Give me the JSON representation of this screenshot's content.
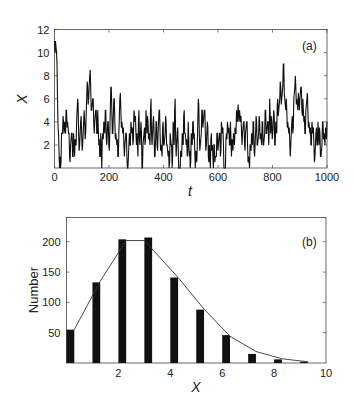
{
  "chart_data": [
    {
      "type": "line",
      "panel_label": "(a)",
      "title": "",
      "xlabel": "t",
      "ylabel": "X",
      "xlim": [
        0,
        1000
      ],
      "ylim": [
        0,
        12
      ],
      "xticks": [
        0,
        200,
        400,
        600,
        800,
        1000
      ],
      "yticks": [
        2,
        4,
        6,
        8,
        10,
        12
      ],
      "grid": false,
      "legend": null,
      "step": 5,
      "x": "0..1000 step 5",
      "values": [
        11,
        11,
        10,
        6,
        3,
        0,
        0,
        3,
        3,
        4,
        4,
        3,
        5,
        4,
        3,
        1,
        2,
        3,
        1,
        3,
        1,
        2,
        4,
        6,
        3,
        2,
        4,
        3,
        2,
        4,
        4,
        3,
        6,
        7,
        6,
        8,
        7,
        5,
        6,
        4,
        4,
        5,
        3,
        5,
        2,
        1,
        3,
        0,
        3,
        4,
        3,
        5,
        2,
        4,
        2,
        3,
        7,
        5,
        3,
        6,
        4,
        3,
        2,
        1,
        3,
        6,
        5,
        4,
        3,
        2,
        2,
        3,
        1,
        0,
        2,
        2,
        4,
        3,
        2,
        5,
        4,
        3,
        3,
        1,
        5,
        2,
        4,
        0,
        2,
        3,
        2,
        5,
        3,
        4,
        3,
        2,
        6,
        2,
        4,
        3,
        1,
        4,
        2,
        3,
        5,
        3,
        2,
        1,
        4,
        2,
        3,
        4,
        2,
        1,
        0,
        3,
        2,
        0,
        4,
        2,
        6,
        1,
        3,
        2,
        0,
        0,
        1,
        3,
        2,
        5,
        3,
        2,
        1,
        4,
        1,
        0,
        3,
        2,
        4,
        3,
        0,
        1,
        2,
        6,
        3,
        2,
        3,
        5,
        4,
        5,
        3,
        2,
        4,
        1,
        2,
        0,
        3,
        2,
        0,
        2,
        1,
        1,
        3,
        2,
        3,
        1,
        4,
        3,
        2,
        0,
        0,
        3,
        4,
        3,
        2,
        4,
        1,
        2,
        3,
        2,
        3,
        5,
        4,
        5,
        5,
        4,
        3,
        3,
        4,
        2,
        3,
        4,
        2,
        1,
        0,
        2,
        3,
        2,
        4,
        1,
        3,
        4
      ],
      "tail_values": [
        2,
        3,
        4,
        3,
        2,
        4,
        2,
        3,
        5,
        3,
        4,
        2,
        6,
        3,
        4,
        3,
        5,
        2,
        4,
        3,
        6,
        5,
        6,
        7,
        6,
        7,
        9,
        6,
        5,
        5,
        4,
        3,
        2,
        2,
        4,
        3,
        6,
        7,
        7,
        6,
        5,
        6,
        6,
        7,
        5,
        6,
        4,
        3,
        5,
        6,
        5,
        4,
        3,
        2,
        4,
        3,
        2,
        1,
        3,
        2,
        4,
        2,
        3,
        1,
        2,
        4,
        3,
        2,
        3,
        4
      ]
    },
    {
      "type": "bar",
      "panel_label": "(b)",
      "title": "",
      "xlabel": "X",
      "ylabel": "Number",
      "xlim": [
        0,
        10
      ],
      "ylim": [
        0,
        240
      ],
      "xticks": [
        2,
        4,
        6,
        8,
        10
      ],
      "yticks": [
        50,
        100,
        150,
        200
      ],
      "grid": false,
      "legend": null,
      "categories": [
        0,
        1,
        2,
        3,
        4,
        5,
        6,
        7,
        8,
        9
      ],
      "values": [
        55,
        133,
        204,
        207,
        141,
        88,
        46,
        15,
        6,
        2
      ],
      "overlay_line": {
        "type": "line",
        "x": [
          0.3,
          1.3,
          2.3,
          3.0,
          4.3,
          5.3,
          6.3,
          7.3,
          8.3,
          9.3
        ],
        "values": [
          55,
          135,
          202,
          202,
          141,
          89,
          44,
          19,
          7,
          2
        ]
      }
    }
  ],
  "labels": {
    "a_panel": "(a)",
    "a_xlabel": "t",
    "a_ylabel": "X",
    "b_panel": "(b)",
    "b_xlabel": "X",
    "b_ylabel": "Number"
  }
}
